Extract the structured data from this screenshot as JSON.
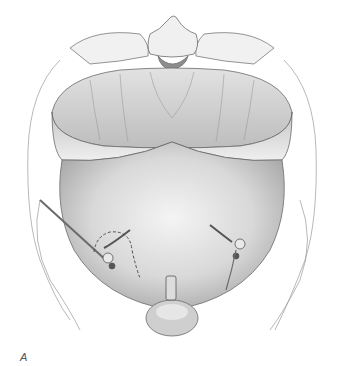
{
  "figure": {
    "panel_label": "A",
    "palette": {
      "background": "#ffffff",
      "line": "#6b6b6b",
      "shade_dark": "#9a9a9a",
      "shade_mid": "#c8c8c8",
      "shade_light": "#e6e6e6"
    }
  }
}
